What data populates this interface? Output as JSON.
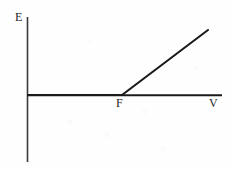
{
  "figure": {
    "background_color": "#fefefe",
    "ink_color": "#1a1a1a",
    "label_color": "#262626"
  },
  "labels": {
    "y_axis": "E",
    "x_axis": "V",
    "threshold": "F"
  },
  "chart_data": {
    "type": "line",
    "title": "",
    "xlabel": "V",
    "ylabel": "E",
    "grid": false,
    "legend": null,
    "axis_origin": {
      "x": 27,
      "y": 95
    },
    "xlim": [
      27,
      222
    ],
    "ylim": [
      17,
      162
    ],
    "annotations": [
      {
        "text": "F",
        "x": 122,
        "y": 95,
        "position": "below-axis",
        "meaning": "threshold-point"
      },
      {
        "text": "E",
        "x": 27,
        "y": 17,
        "position": "above-y-axis-top",
        "meaning": "y-axis-name"
      },
      {
        "text": "V",
        "x": 222,
        "y": 95,
        "position": "below-x-axis-right",
        "meaning": "x-axis-name"
      }
    ],
    "series": [
      {
        "name": "E versus V",
        "points": [
          {
            "x": 27,
            "y": 95
          },
          {
            "x": 122,
            "y": 95
          },
          {
            "x": 208,
            "y": 30
          }
        ],
        "description": "Flat at zero until threshold F, then rises linearly"
      }
    ],
    "segments": [
      {
        "name": "flat-segment",
        "x1": 27,
        "y1": 95,
        "x2": 122,
        "y2": 95
      },
      {
        "name": "rising-segment",
        "x1": 122,
        "y1": 95,
        "x2": 208,
        "y2": 30
      }
    ],
    "axes": {
      "y_axis": {
        "x1": 27,
        "y1": 17,
        "x2": 27,
        "y2": 162
      },
      "x_axis": {
        "x1": 27,
        "y1": 95,
        "x2": 222,
        "y2": 95
      }
    }
  }
}
